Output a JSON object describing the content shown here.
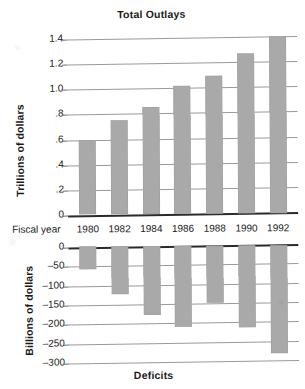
{
  "figure": {
    "bar_color": "#a9a9a9",
    "gridline_color": "#9a9a9a",
    "axis_color": "#2b2b2b"
  },
  "fiscal_year": {
    "label": "Fiscal year",
    "years": [
      "1980",
      "1982",
      "1984",
      "1986",
      "1988",
      "1990",
      "1992"
    ]
  },
  "top_chart": {
    "title": "Total Outlays",
    "ylabel": "Trillions of dollars",
    "yticks": [
      "1.4",
      "1.2",
      "1.0",
      ".8",
      ".6",
      ".4",
      ".2",
      "0"
    ]
  },
  "bottom_chart": {
    "title": "Deficits",
    "ylabel": "Billions of dollars",
    "yticks": [
      "0",
      "–50",
      "–100",
      "–150",
      "–200",
      "–250",
      "–300"
    ]
  },
  "chart_data": [
    {
      "type": "bar",
      "title": "Total Outlays",
      "xlabel": "Fiscal year",
      "ylabel": "Trillions of dollars",
      "categories": [
        "1980",
        "1982",
        "1984",
        "1986",
        "1988",
        "1990",
        "1992"
      ],
      "values": [
        0.59,
        0.75,
        0.85,
        1.02,
        1.1,
        1.27,
        1.41
      ],
      "ylim": [
        0,
        1.4
      ],
      "ytick_values": [
        0,
        0.2,
        0.4,
        0.6,
        0.8,
        1.0,
        1.2,
        1.4
      ],
      "ytick_labels": [
        "0",
        ".2",
        ".4",
        ".6",
        ".8",
        "1.0",
        "1.2",
        "1.4"
      ],
      "grid": true,
      "legend": false,
      "bar_color": "#a9a9a9"
    },
    {
      "type": "bar",
      "title": "Deficits",
      "xlabel": "Fiscal year",
      "ylabel": "Billions of dollars",
      "categories": [
        "1980",
        "1982",
        "1984",
        "1986",
        "1988",
        "1990",
        "1992"
      ],
      "values": [
        -60,
        -125,
        -178,
        -210,
        -148,
        -212,
        -280
      ],
      "ylim": [
        -300,
        0
      ],
      "ytick_values": [
        0,
        -50,
        -100,
        -150,
        -200,
        -250,
        -300
      ],
      "ytick_labels": [
        "0",
        "–50",
        "–100",
        "–150",
        "–200",
        "–250",
        "–300"
      ],
      "grid": true,
      "legend": false,
      "bar_color": "#a9a9a9"
    }
  ]
}
